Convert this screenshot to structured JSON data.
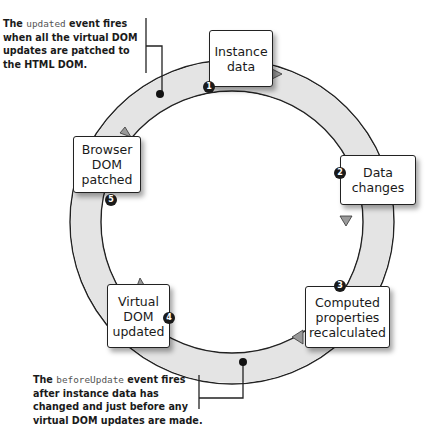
{
  "diagram": {
    "colors": {
      "ring_fill": "#e6e6e6",
      "outline": "#222222",
      "badge": "#1a1a1a",
      "box_fill": "#ffffff",
      "code_text": "#555555"
    },
    "steps": [
      {
        "number": "1",
        "label": "Instance\ndata"
      },
      {
        "number": "2",
        "label": "Data\nchanges"
      },
      {
        "number": "3",
        "label": "Computed\nproperties\nrecalculated"
      },
      {
        "number": "4",
        "label": "Virtual\nDOM\nupdated"
      },
      {
        "number": "5",
        "label": "Browser\nDOM\npatched"
      }
    ],
    "notes": {
      "updated": {
        "prefix": "The ",
        "code": "updated",
        "line1_rest": " event fires",
        "line2": "when all the virtual DOM",
        "line3": "updates are patched to",
        "line4": "the HTML DOM."
      },
      "before_update": {
        "prefix": "The ",
        "code": "beforeUpdate",
        "line1_rest": " event fires",
        "line2": "after instance data has",
        "line3": "changed and just before any",
        "line4": "virtual DOM updates are made."
      }
    }
  }
}
